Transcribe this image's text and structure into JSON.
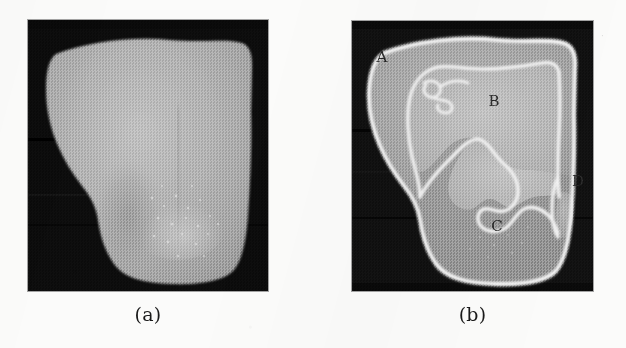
{
  "figure": {
    "kind": "two-panel grayscale scanned figure",
    "background_color": "#fbfbfa",
    "panels": [
      {
        "id": "a",
        "caption": "(a)",
        "description": "original grayscale image of specimen",
        "frame": {
          "x": 28,
          "y": 20,
          "width": 240,
          "height": 271
        },
        "background_color": "#0d0d0d",
        "fill_color": "#a8a8a8",
        "labels": []
      },
      {
        "id": "b",
        "caption": "(b)",
        "description": "segmented image with white contours and region labels",
        "frame": {
          "x": 352,
          "y": 21,
          "width": 241,
          "height": 270
        },
        "background_color": "#111111",
        "contour_color": "#f2f2f2",
        "labels": [
          {
            "text": "A",
            "x": 382,
            "y": 62
          },
          {
            "text": "B",
            "x": 494,
            "y": 106
          },
          {
            "text": "C",
            "x": 497,
            "y": 231
          },
          {
            "text": "D",
            "x": 578,
            "y": 186
          }
        ]
      }
    ],
    "region_names": [
      "A",
      "B",
      "C",
      "D"
    ],
    "artifacts": [
      {
        "name": "scan-speck",
        "x": 601,
        "y": 31,
        "glyph": "·"
      }
    ]
  }
}
